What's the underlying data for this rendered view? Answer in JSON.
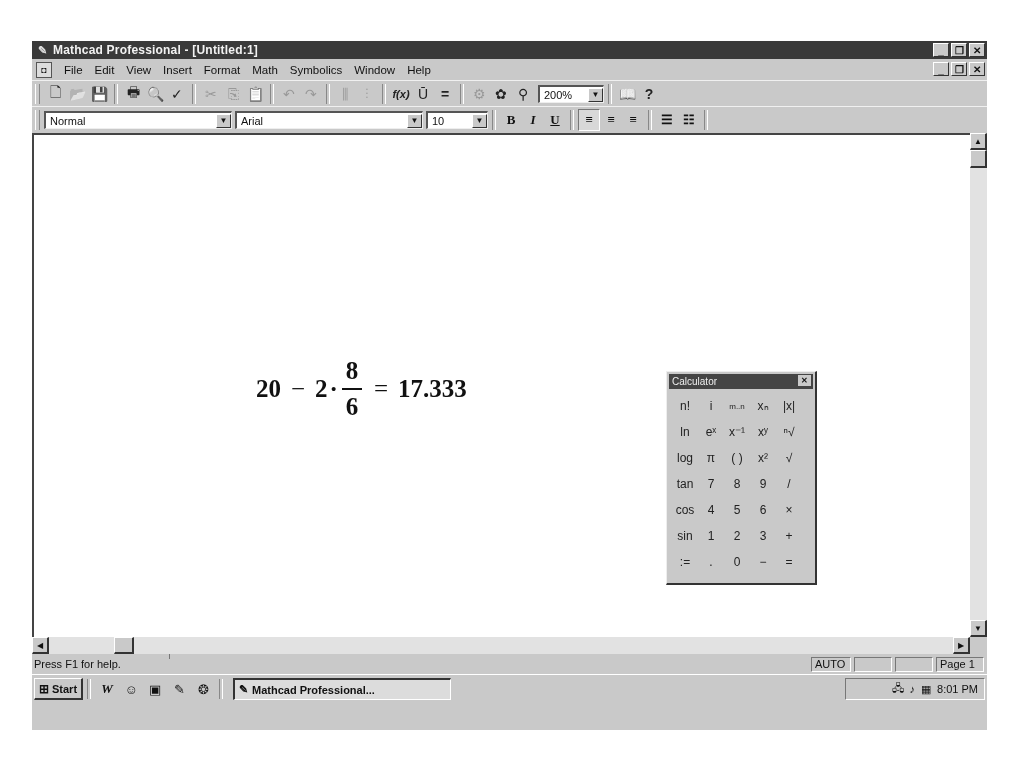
{
  "window": {
    "title": "Mathcad Professional - [Untitled:1]",
    "app_icon": "mathcad-icon",
    "controls": {
      "minimize": "_",
      "restore": "❐",
      "close": "✕"
    }
  },
  "menubar": {
    "doc_icon": "document-icon",
    "items": [
      {
        "label": "File",
        "accel": "F"
      },
      {
        "label": "Edit",
        "accel": "E"
      },
      {
        "label": "View",
        "accel": "V"
      },
      {
        "label": "Insert",
        "accel": "I"
      },
      {
        "label": "Format",
        "accel": "o"
      },
      {
        "label": "Math",
        "accel": "M"
      },
      {
        "label": "Symbolics",
        "accel": "S"
      },
      {
        "label": "Window",
        "accel": "W"
      },
      {
        "label": "Help",
        "accel": "H"
      }
    ]
  },
  "standard_toolbar": {
    "buttons": [
      {
        "name": "new",
        "glyph": "🗋"
      },
      {
        "name": "open",
        "glyph": "📂"
      },
      {
        "name": "save",
        "glyph": "💾"
      },
      {
        "name": "print",
        "glyph": "🖶"
      },
      {
        "name": "print-preview",
        "glyph": "🔍"
      },
      {
        "name": "spell-check",
        "glyph": "✓"
      },
      {
        "name": "cut",
        "glyph": "✂"
      },
      {
        "name": "copy",
        "glyph": "⎘"
      },
      {
        "name": "paste",
        "glyph": "📋"
      },
      {
        "name": "undo",
        "glyph": "↶"
      },
      {
        "name": "redo",
        "glyph": "↷"
      },
      {
        "name": "align-across",
        "glyph": "⫼"
      },
      {
        "name": "align-down",
        "glyph": "⫶"
      },
      {
        "name": "insert-function",
        "glyph": "f(x)"
      },
      {
        "name": "insert-unit",
        "glyph": "Ū"
      },
      {
        "name": "calculate",
        "glyph": "="
      },
      {
        "name": "insert-component",
        "glyph": "⚙"
      },
      {
        "name": "insert-resource",
        "glyph": "✿"
      },
      {
        "name": "electronic-book",
        "glyph": "⚲"
      }
    ],
    "zoom": "200%",
    "resource_center_glyph": "📖",
    "help_glyph": "?"
  },
  "format_toolbar": {
    "style": "Normal",
    "font": "Arial",
    "size": "10",
    "bold": "B",
    "italic": "I",
    "underline": "U",
    "align_left": "≡",
    "align_center": "≡",
    "align_right": "≡",
    "bullets": "☰",
    "numbering": "☷"
  },
  "document": {
    "expression": {
      "lhs_a": "20",
      "minus": "−",
      "lhs_b": "2",
      "dot": "·",
      "numerator": "8",
      "denominator": "6",
      "equals": "=",
      "result": "17.333"
    }
  },
  "calculator": {
    "title": "Calculator",
    "close": "✕",
    "keys": [
      "n!",
      "i",
      "m..n",
      "xₙ",
      "|x|",
      "ln",
      "eˣ",
      "x⁻¹",
      "xʸ",
      "ⁿ√",
      "log",
      "π",
      "( )",
      "x²",
      "√",
      "tan",
      "7",
      "8",
      "9",
      "/",
      "cos",
      "4",
      "5",
      "6",
      "×",
      "sin",
      "1",
      "2",
      "3",
      "+",
      ":=",
      ".",
      "0",
      "−",
      "="
    ]
  },
  "statusbar": {
    "help_text": "Press F1 for help.",
    "mode": "AUTO",
    "panel2": "",
    "panel3": "",
    "page": "Page 1"
  },
  "taskbar": {
    "start_label": "Start",
    "quick_launch": [
      "W",
      "☺",
      "▣",
      "✎",
      "❂"
    ],
    "task_label": "Mathcad Professional...",
    "tray_icons": [
      "🖧",
      "♪",
      "▦"
    ],
    "clock": "8:01 PM"
  }
}
